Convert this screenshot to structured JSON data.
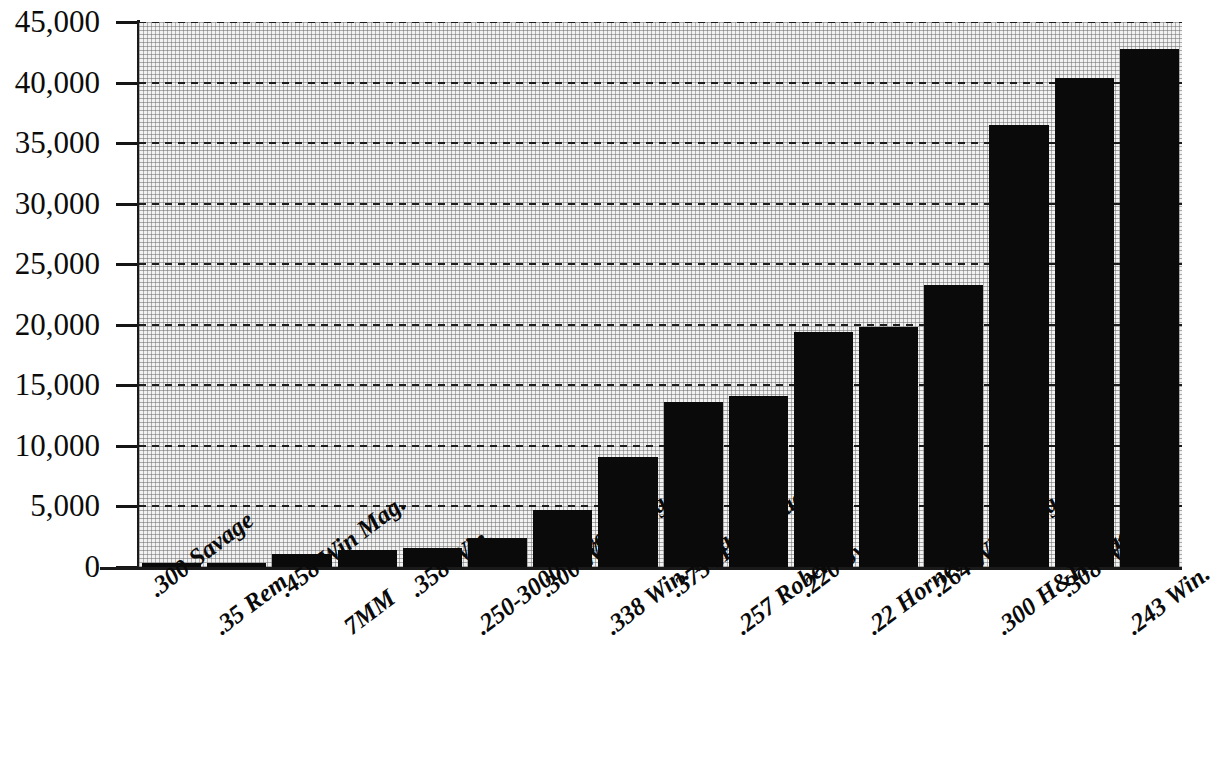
{
  "chart_data": {
    "type": "bar",
    "title": "",
    "subtitle": "",
    "xlabel": "",
    "ylabel": "",
    "ylim": [
      0,
      45000
    ],
    "ytick_step": 5000,
    "grid": true,
    "legend": null,
    "bar_color": "#0a0a0a",
    "plot_background": "#f2f2f2",
    "categories": [
      ".300 Savage",
      ".35 Rem",
      ".458 Win Mag.",
      "7MM",
      ".358 Win.",
      ".250-3000 Savage",
      ".300 Win. Mag.",
      ".338 Win. Mag.",
      ".375 H&H Mag.",
      ".257 Roberts",
      ".220 Swift",
      ".22 Hornet",
      ".264 Win. Mag.",
      ".300 H&H Mag.",
      ".308 Win.",
      ".243 Win."
    ],
    "values": [
      300,
      300,
      1100,
      1400,
      1600,
      2400,
      4700,
      9100,
      13600,
      14100,
      19400,
      19800,
      23300,
      36500,
      40400,
      42800
    ],
    "ytick_labels": [
      "45,000",
      "40,000",
      "35,000",
      "30,000",
      "25,000",
      "20,000",
      "15,000",
      "10,000",
      "5,000",
      "0"
    ],
    "ytick_values": [
      45000,
      40000,
      35000,
      30000,
      25000,
      20000,
      15000,
      10000,
      5000,
      0
    ]
  }
}
